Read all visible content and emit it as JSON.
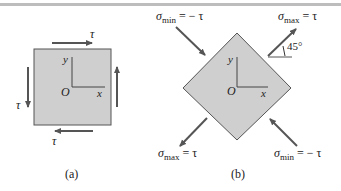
{
  "colors": {
    "element_fill": "#cfcfcf",
    "element_stroke": "#555555",
    "arrow": "#555555",
    "text": "#222222",
    "top_rule": "#bdbdbd"
  },
  "panel_a": {
    "caption": "(a)",
    "shear_label_top": "τ",
    "shear_label_left": "τ",
    "shear_label_bottom": "τ",
    "axis_y": "y",
    "axis_x": "x",
    "origin": "O"
  },
  "panel_b": {
    "caption": "(b)",
    "axis_y": "y",
    "axis_x": "x",
    "origin": "O",
    "angle": "45°",
    "sigma": "σ",
    "top_left": {
      "sub": "min",
      "rhs": " = − τ"
    },
    "top_right": {
      "sub": "max",
      "rhs": " = τ"
    },
    "bottom_left": {
      "sub": "max",
      "rhs": " = τ"
    },
    "bottom_right": {
      "sub": "min",
      "rhs": " = − τ"
    }
  }
}
